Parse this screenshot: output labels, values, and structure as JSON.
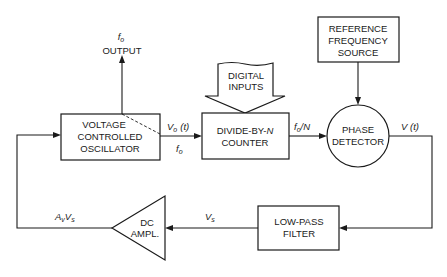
{
  "diagram": {
    "blocks": {
      "vco": {
        "lines": [
          "VOLTAGE",
          "CONTROLLED",
          "OSCILLATOR"
        ]
      },
      "divider": {
        "line1_prefix": "DIVIDE-BY-",
        "line1_var": "N",
        "line2": "COUNTER"
      },
      "reference": {
        "lines": [
          "REFERENCE",
          "FREQUENCY",
          "SOURCE"
        ]
      },
      "phase_detector": {
        "lines": [
          "PHASE",
          "DETECTOR"
        ]
      },
      "low_pass_filter": {
        "lines": [
          "LOW-PASS",
          "FILTER"
        ]
      },
      "dc_amplifier": {
        "lines": [
          "DC",
          "AMPL."
        ]
      },
      "digital_inputs": {
        "lines": [
          "DIGITAL",
          "INPUTS"
        ]
      }
    },
    "signals": {
      "output_freq": "f",
      "output_freq_sub": "o",
      "output_label": "OUTPUT",
      "vco_out_v": "V",
      "vco_out_v_sub": "o",
      "vco_out_v_arg": "(t)",
      "vco_out_f": "f",
      "vco_out_f_sub": "o",
      "divided_f": "f",
      "divided_f_sub": "o",
      "divided_f_suffix": "/N",
      "pd_out": "V (t)",
      "filter_out": "V",
      "filter_out_sub": "s",
      "amp_out_a": "A",
      "amp_out_a_sub": "v",
      "amp_out_v": "V",
      "amp_out_v_sub": "s"
    },
    "colors": {
      "line": "#1a1a1a",
      "background": "#ffffff"
    }
  }
}
